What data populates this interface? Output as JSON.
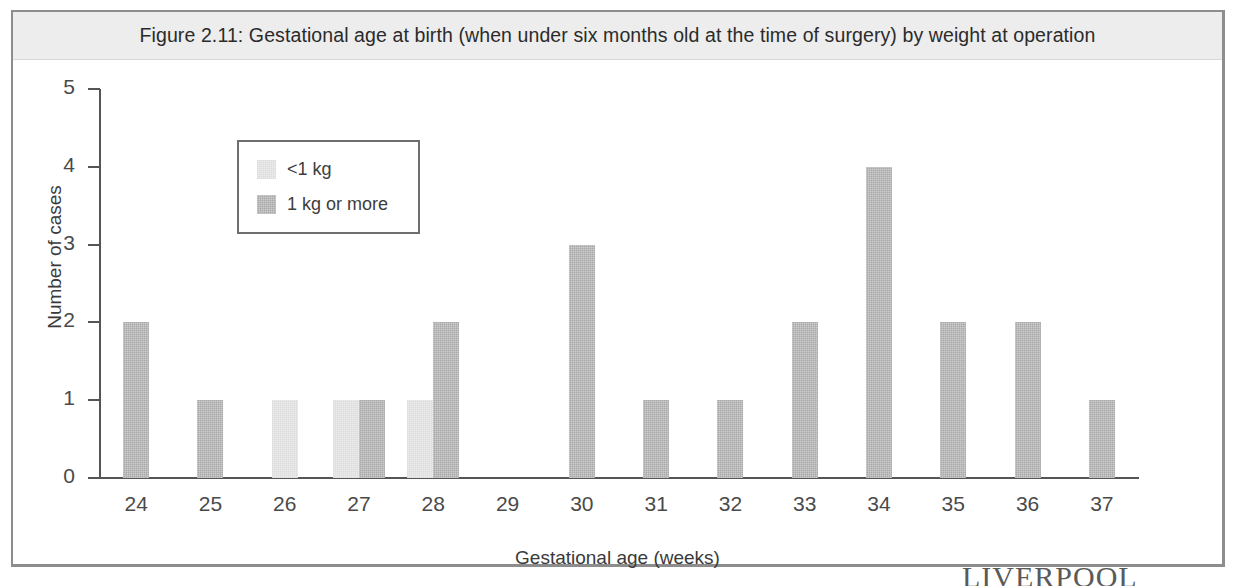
{
  "figure": {
    "title": "Figure 2.11: Gestational age at birth (when under six months old at the time of surgery) by weight at operation"
  },
  "watermark": {
    "text": "LIVERPOOL"
  },
  "colors": {
    "light_series": "#ececec",
    "dark_series": "#a9a9a9",
    "axis": "#555555",
    "title_band": "#ededed",
    "frame": "#8d8d8d"
  },
  "chart_data": {
    "type": "bar",
    "title": "Figure 2.11: Gestational age at birth (when under six months old at the time of surgery) by weight at operation",
    "xlabel": "Gestational age (weeks)",
    "ylabel": "Number of cases",
    "categories": [
      "24",
      "25",
      "26",
      "27",
      "28",
      "29",
      "30",
      "31",
      "32",
      "33",
      "34",
      "35",
      "36",
      "37"
    ],
    "series": [
      {
        "name": "<1 kg",
        "color": "#ececec",
        "values": [
          0,
          0,
          1,
          1,
          1,
          0,
          0,
          0,
          0,
          0,
          0,
          0,
          0,
          0
        ]
      },
      {
        "name": "1 kg or more",
        "color": "#a9a9a9",
        "values": [
          2,
          1,
          0,
          1,
          2,
          0,
          3,
          1,
          1,
          2,
          4,
          2,
          2,
          1
        ]
      }
    ],
    "ylim": [
      0,
      5
    ],
    "yticks": [
      0,
      1,
      2,
      3,
      4,
      5
    ],
    "ytick_labels": [
      "0",
      "1",
      "2",
      "3",
      "4",
      "5"
    ],
    "grid": false,
    "legend_position": "upper-left-inset"
  },
  "legend": {
    "entries": [
      {
        "label": "<1 kg"
      },
      {
        "label": "1 kg or more"
      }
    ]
  }
}
